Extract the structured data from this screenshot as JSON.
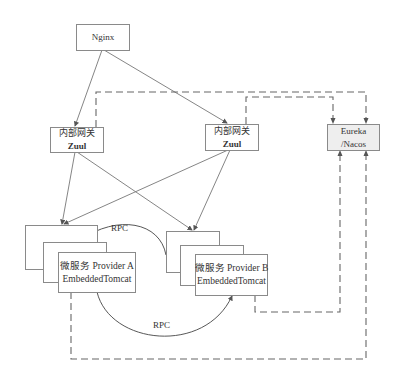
{
  "nodes": {
    "nginx": {
      "label": "Nginx"
    },
    "zuul_left": {
      "line1": "内部网关",
      "line2": "Zuul"
    },
    "zuul_right": {
      "line1": "内部网关",
      "line2": "Zuul"
    },
    "registry": {
      "line1": "Eureka",
      "line2": "/Nacos"
    },
    "provider_a": {
      "line1": "微服务 Provider A",
      "line2": "EmbeddedTomcat"
    },
    "provider_b": {
      "line1": "微服务 Provider B",
      "line2": "EmbeddedTomcat"
    }
  },
  "edges": {
    "rpc_top": "RPC",
    "rpc_bottom": "RPC"
  },
  "colors": {
    "line": "#777777",
    "box_border": "#8a8a8a",
    "registry_fill": "#eeeeee"
  }
}
